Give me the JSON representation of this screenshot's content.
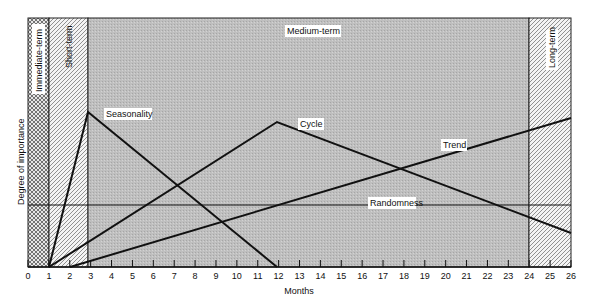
{
  "chart_data": {
    "type": "line",
    "title": "",
    "xlabel": "Months",
    "ylabel": "Degree of importance",
    "xlim": [
      0,
      26
    ],
    "ylim": [
      0,
      100
    ],
    "x_ticks": [
      0,
      1,
      2,
      3,
      4,
      5,
      6,
      7,
      8,
      9,
      10,
      11,
      12,
      13,
      14,
      15,
      16,
      17,
      18,
      19,
      20,
      21,
      22,
      23,
      24,
      25,
      26
    ],
    "grid": false,
    "legend": "none (inline labels)",
    "regions": [
      {
        "name": "Immediate-term",
        "x_start": 0,
        "x_end": 1,
        "pattern": "crosshatch"
      },
      {
        "name": "Short-term",
        "x_start": 1,
        "x_end": 3,
        "pattern": "diagonal-hatch"
      },
      {
        "name": "Medium-term",
        "x_start": 3,
        "x_end": 24,
        "pattern": "grey-stipple"
      },
      {
        "name": "Long-term",
        "x_start": 24,
        "x_end": 26,
        "pattern": "diagonal-hatch"
      }
    ],
    "series": [
      {
        "name": "Seasonality",
        "points": [
          [
            1,
            0
          ],
          [
            3,
            62
          ],
          [
            12,
            0
          ]
        ]
      },
      {
        "name": "Cycle",
        "points": [
          [
            1,
            0
          ],
          [
            12,
            58
          ],
          [
            26,
            14
          ]
        ]
      },
      {
        "name": "Trend",
        "points": [
          [
            2,
            0
          ],
          [
            26,
            60
          ]
        ]
      },
      {
        "name": "Randomness",
        "points": [
          [
            0,
            25
          ],
          [
            26,
            25
          ]
        ]
      }
    ]
  },
  "labels": {
    "region_immediate": "Immediate-term",
    "region_short": "Short-term",
    "region_medium": "Medium-term",
    "region_long": "Long-term",
    "seasonality": "Seasonality",
    "cycle": "Cycle",
    "trend": "Trend",
    "randomness": "Randomness",
    "xlabel": "Months",
    "ylabel": "Degree of importance"
  },
  "colors": {
    "medium_fill": "#bdbdbd",
    "line": "#111111",
    "hatch": "#555555",
    "background": "#ffffff"
  }
}
